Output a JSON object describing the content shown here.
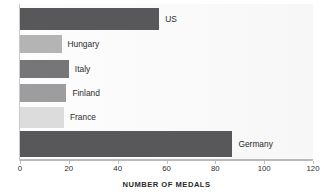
{
  "chart_data": {
    "type": "bar",
    "orientation": "horizontal",
    "title": "",
    "xlabel": "NUMBER OF MEDALS",
    "ylabel": "TOP SIX WINNING NATIONS",
    "xlim": [
      0,
      120
    ],
    "xticks": [
      0,
      20,
      40,
      60,
      80,
      100,
      120
    ],
    "xtick_labels": [
      "0",
      "20",
      "40",
      "60",
      "80",
      "100",
      "120"
    ],
    "grid": false,
    "legend": "none",
    "categories": [
      "US",
      "Hungary",
      "Italy",
      "Finland",
      "France",
      "Germany"
    ],
    "values": [
      57,
      17,
      20,
      19,
      18,
      87
    ],
    "bars": [
      {
        "label": "US",
        "value": 57,
        "color": "#58585a"
      },
      {
        "label": "Hungary",
        "value": 17,
        "color": "#b4b4b4"
      },
      {
        "label": "Italy",
        "value": 20,
        "color": "#767678"
      },
      {
        "label": "Finland",
        "value": 19,
        "color": "#9d9d9f"
      },
      {
        "label": "France",
        "value": 18,
        "color": "#dcdcdc"
      },
      {
        "label": "Germany",
        "value": 87,
        "color": "#58585a"
      }
    ],
    "colors": {
      "axis": "#b9b9b9",
      "text": "#2b2b2b",
      "plot_background": "#fbfbfb",
      "dark_bar": "#58585a",
      "light_bar": "#dcdcdc"
    }
  }
}
